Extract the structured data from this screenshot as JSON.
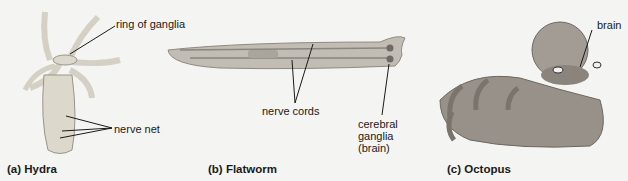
{
  "figure": {
    "panels": [
      {
        "id": "a",
        "caption": "(a) Hydra",
        "labels": {
          "ring": "ring of ganglia",
          "net": "nerve net"
        }
      },
      {
        "id": "b",
        "caption": "(b) Flatworm",
        "labels": {
          "cords": "nerve cords",
          "ganglia_line1": "cerebral",
          "ganglia_line2": "ganglia",
          "ganglia_line3": "(brain)"
        }
      },
      {
        "id": "c",
        "caption": "(c) Octopus",
        "labels": {
          "brain": "brain"
        }
      }
    ],
    "colors": {
      "background": "#f4f4f2",
      "ink": "#1a1a1a",
      "hydra": "#dcd8cc",
      "flatworm": "#b9b5ad",
      "octopus": "#8d8882"
    }
  }
}
